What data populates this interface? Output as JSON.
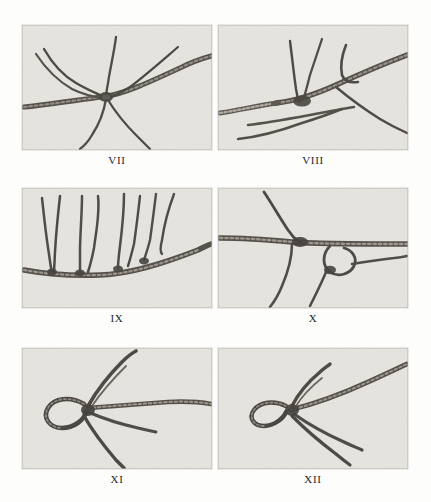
{
  "page": {
    "kind": "photographic-plate-sheet",
    "background_color": "#fdfdfc",
    "plate_background_color": "#e6e4df",
    "rope_dark_color": "#4a4742",
    "rope_mid_color": "#6f6b63",
    "columns": 2,
    "rows": 3
  },
  "plates": [
    {
      "id": "vii",
      "caption": "VII",
      "subject": "multi-strand rope junction with five radiating cords",
      "row": 1,
      "column": 1
    },
    {
      "id": "viii",
      "caption": "VIII",
      "subject": "rope crossing with spliced side cords and two free tails",
      "row": 1,
      "column": 2
    },
    {
      "id": "ix",
      "caption": "IX",
      "subject": "horizontal rope with five vertical cords attached in a row",
      "row": 2,
      "column": 1
    },
    {
      "id": "x",
      "caption": "X",
      "subject": "horizontal rope with looped knot and descending cords",
      "row": 2,
      "column": 2
    },
    {
      "id": "xi",
      "caption": "XI",
      "subject": "rope end formed into an eye loop with three frayed tails",
      "row": 3,
      "column": 1
    },
    {
      "id": "xii",
      "caption": "XII",
      "subject": "rope end with small eye loop and three frayed tails",
      "row": 3,
      "column": 2
    }
  ]
}
